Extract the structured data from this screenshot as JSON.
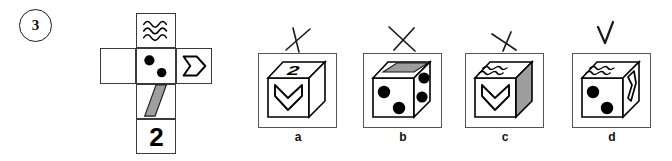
{
  "question": {
    "number": "3",
    "type": "cube-net-folding"
  },
  "net": {
    "label": "unfolded-cube-net",
    "faces": [
      {
        "id": "top",
        "symbol": "wavy-lines",
        "symbol_count": 3,
        "text": ""
      },
      {
        "id": "left",
        "symbol": "blank",
        "symbol_count": 0,
        "text": ""
      },
      {
        "id": "middle",
        "symbol": "two-dots",
        "symbol_count": 2,
        "text": ""
      },
      {
        "id": "right",
        "symbol": "chevron-arrow",
        "symbol_count": 1,
        "text": ""
      },
      {
        "id": "lower",
        "symbol": "gray-parallelogram",
        "symbol_count": 1,
        "text": ""
      },
      {
        "id": "bottom",
        "symbol": "number",
        "symbol_count": 0,
        "text": "2"
      }
    ]
  },
  "options": [
    {
      "key": "a",
      "label": "a",
      "mark": "x-cross",
      "faces": {
        "top": "number-2",
        "front": "chevron-arrow",
        "side": "blank"
      }
    },
    {
      "key": "b",
      "label": "b",
      "mark": "x-cross",
      "faces": {
        "top": "gray-parallelogram",
        "front": "two-dots",
        "side": "two-dots"
      }
    },
    {
      "key": "c",
      "label": "c",
      "mark": "x-cross",
      "faces": {
        "top": "wavy-lines",
        "front": "chevron-arrow",
        "side": "gray-shaded"
      }
    },
    {
      "key": "d",
      "label": "d",
      "mark": "check",
      "faces": {
        "top": "wavy-lines",
        "front": "two-dots",
        "side": "chevron-arrow"
      }
    }
  ],
  "colors": {
    "ink": "#000000",
    "outline": "#3a3a3a",
    "box_outline": "#555555",
    "gray_fill": "#9e9e9e",
    "background": "#ffffff"
  }
}
